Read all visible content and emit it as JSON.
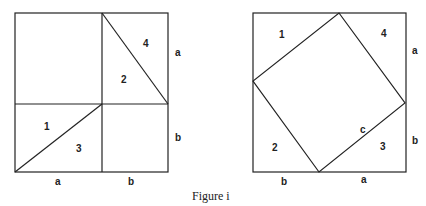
{
  "caption": "Figure i",
  "left_figure": {
    "regions": [
      "1",
      "2",
      "3",
      "4"
    ],
    "side_labels": {
      "bottom_left": "a",
      "bottom_right": "b",
      "right_top": "a",
      "right_bottom": "b"
    }
  },
  "right_figure": {
    "regions": [
      "1",
      "2",
      "3",
      "4"
    ],
    "hypotenuse_label": "c",
    "side_labels": {
      "bottom_left": "b",
      "bottom_right": "a",
      "right_top": "a",
      "right_bottom": "b"
    }
  }
}
